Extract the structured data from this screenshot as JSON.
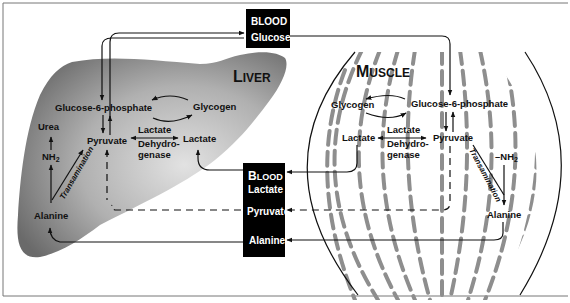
{
  "liver": {
    "title_cap": "L",
    "title_rest": "IVER",
    "glucose6p": "Glucose-6-phosphate",
    "glycogen": "Glycogen",
    "pyruvate": "Pyruvate",
    "lactate": "Lactate",
    "ldh_line1": "Lactate",
    "ldh_line2": "Dehydro-",
    "ldh_line3": "genase",
    "urea": "Urea",
    "nh2": "NH",
    "nh2_sub": "2",
    "alanine": "Alanine",
    "transamination": "Transamination"
  },
  "muscle": {
    "title_cap": "M",
    "title_rest": "USCLE",
    "glycogen": "Glycogen",
    "glucose6p": "Glucose-6-phosphate",
    "lactate": "Lactate",
    "pyruvate": "Pyruvate",
    "ldh_line1": "Lactate",
    "ldh_line2": "Dehydro-",
    "ldh_line3": "genase",
    "nh2": "–NH",
    "nh2_sub": "2",
    "alanine": "Alanine",
    "transamination": "Transamination"
  },
  "blood_glucose": {
    "line1": "BLOOD",
    "line2": "Glucose"
  },
  "blood_box": {
    "cap": "B",
    "rest": "LOOD",
    "lactate": "Lactate",
    "pyruvate": "Pyruvate",
    "alanine": "Alanine"
  },
  "colors": {
    "liver_dark": "#6f6f6f",
    "liver_light": "#d9d9d9",
    "fiber": "#8e8e8e",
    "box": "#000000"
  }
}
